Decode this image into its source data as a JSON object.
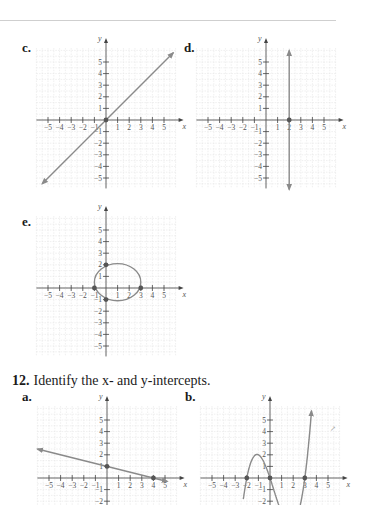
{
  "page": {
    "top_rule": true,
    "problem": {
      "number": "12.",
      "text": "Identify the x- and y-intercepts."
    },
    "stray_mark": "↗"
  },
  "graphs": [
    {
      "id": "c",
      "label": "c.",
      "x_ticks": [
        "−5",
        "−4",
        "−3",
        "−2",
        "−1",
        "1",
        "2",
        "3",
        "4",
        "5"
      ],
      "y_ticks": [
        "5",
        "4",
        "3",
        "2",
        "1",
        "−1",
        "−2",
        "−3",
        "−4",
        "−5"
      ],
      "x_axis_label": "x",
      "y_axis_label": "y"
    },
    {
      "id": "d",
      "label": "d.",
      "x_ticks": [
        "−5",
        "−4",
        "−3",
        "−2",
        "−1",
        "1",
        "2",
        "3",
        "4",
        "5"
      ],
      "y_ticks": [
        "5",
        "4",
        "3",
        "2",
        "1",
        "−1",
        "−2",
        "−3",
        "−4",
        "−5"
      ],
      "x_axis_label": "x",
      "y_axis_label": "y"
    },
    {
      "id": "e",
      "label": "e.",
      "x_ticks": [
        "−5",
        "−4",
        "−3",
        "−2",
        "−1",
        "1",
        "2",
        "3",
        "4",
        "5"
      ],
      "y_ticks": [
        "5",
        "4",
        "3",
        "2",
        "1",
        "−1",
        "−2",
        "−3",
        "−4",
        "−5"
      ],
      "x_axis_label": "x",
      "y_axis_label": "y"
    },
    {
      "id": "12a",
      "label": "a.",
      "x_ticks": [
        "−5",
        "−4",
        "−3",
        "−2",
        "−1",
        "1",
        "2",
        "3",
        "4",
        "5"
      ],
      "y_ticks": [
        "5",
        "4",
        "3",
        "2",
        "1",
        "−1",
        "−2"
      ],
      "x_axis_label": "x",
      "y_axis_label": "y"
    },
    {
      "id": "12b",
      "label": "b.",
      "x_ticks": [
        "−5",
        "−4",
        "−3",
        "−2",
        "−1",
        "1",
        "2",
        "3",
        "4",
        "5"
      ],
      "y_ticks": [
        "5",
        "4",
        "3",
        "2",
        "1",
        "−1",
        "−2"
      ],
      "x_axis_label": "x",
      "y_axis_label": "y"
    }
  ],
  "chart_data": [
    {
      "type": "line",
      "title": "c.",
      "xlabel": "x",
      "ylabel": "y",
      "xlim": [
        -5,
        5
      ],
      "ylim": [
        -5,
        5
      ],
      "grid": true,
      "series": [
        {
          "name": "y = x",
          "x": [
            -5.5,
            0,
            5.8
          ],
          "y": [
            -5.5,
            0,
            5.8
          ]
        }
      ],
      "points": [
        {
          "x": 0,
          "y": 0
        }
      ]
    },
    {
      "type": "line",
      "title": "d.",
      "xlabel": "x",
      "ylabel": "y",
      "xlim": [
        -5,
        5
      ],
      "ylim": [
        -5,
        5
      ],
      "grid": true,
      "series": [
        {
          "name": "x = 2",
          "x": [
            2,
            2
          ],
          "y": [
            -6,
            6
          ]
        }
      ],
      "points": [
        {
          "x": 2,
          "y": 0
        }
      ]
    },
    {
      "type": "line",
      "title": "e.",
      "xlabel": "x",
      "ylabel": "y",
      "xlim": [
        -5,
        5
      ],
      "ylim": [
        -5,
        5
      ],
      "grid": true,
      "series": [
        {
          "name": "ellipse",
          "center": [
            1,
            0.5
          ],
          "rx": 2,
          "ry": 1.6
        }
      ],
      "points": [
        {
          "x": -1,
          "y": 0
        },
        {
          "x": 3,
          "y": 0
        },
        {
          "x": 0,
          "y": 2
        },
        {
          "x": 0,
          "y": -1
        }
      ]
    },
    {
      "type": "line",
      "title": "12a.",
      "xlabel": "x",
      "ylabel": "y",
      "xlim": [
        -5,
        5
      ],
      "ylim": [
        -2,
        5
      ],
      "grid": true,
      "series": [
        {
          "name": "line",
          "x": [
            -6,
            0,
            4,
            5.2
          ],
          "y": [
            2.5,
            1,
            0,
            -0.3
          ]
        }
      ],
      "points": [
        {
          "x": 0,
          "y": 1
        },
        {
          "x": 4,
          "y": 0
        }
      ]
    },
    {
      "type": "line",
      "title": "12b.",
      "xlabel": "x",
      "ylabel": "y",
      "xlim": [
        -5,
        5
      ],
      "ylim": [
        -2,
        5
      ],
      "grid": true,
      "series": [
        {
          "name": "cubic",
          "x": [
            -2.3,
            -2,
            -1,
            0,
            1,
            2,
            3,
            3.6
          ],
          "y": [
            -2.3,
            0,
            2,
            0,
            -2.3,
            -2.5,
            0,
            5.8
          ]
        }
      ],
      "points": [
        {
          "x": -2,
          "y": 0
        },
        {
          "x": 0,
          "y": 0
        },
        {
          "x": 3,
          "y": 0
        }
      ]
    }
  ]
}
